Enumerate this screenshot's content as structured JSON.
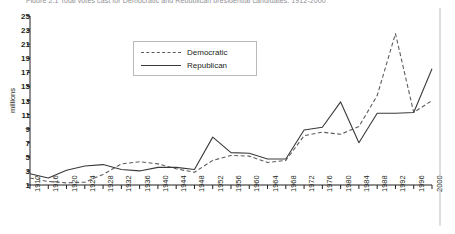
{
  "figure": {
    "caption": "Figure 2.1  Total votes cast for Democratic and Republican presidential candidates, 1912-2000"
  },
  "chart_data": {
    "type": "line",
    "title": "",
    "xlabel": "",
    "ylabel": "millions",
    "x": [
      1912,
      1916,
      1920,
      1924,
      1928,
      1932,
      1936,
      1940,
      1944,
      1948,
      1952,
      1956,
      1960,
      1964,
      1968,
      1972,
      1976,
      1980,
      1984,
      1988,
      1992,
      1996,
      2000
    ],
    "xlim": [
      1912,
      2000
    ],
    "ylim": [
      0,
      25
    ],
    "yticks": [
      1,
      3,
      5,
      7,
      9,
      11,
      13,
      15,
      17,
      19,
      21,
      23,
      25
    ],
    "xticks": [
      "1912",
      "1916",
      "1920",
      "1924",
      "1928",
      "1932",
      "1936",
      "1940",
      "1944",
      "1948",
      "1952",
      "1956",
      "1960",
      "1964",
      "1968",
      "1972",
      "1976",
      "1980",
      "1984",
      "1988",
      "1992",
      "1996",
      "2000"
    ],
    "grid": false,
    "legend_position": "upper-center",
    "series": [
      {
        "name": "Democratic",
        "style": "dashed",
        "color": "#5d5d60",
        "values": [
          6.3,
          9.1,
          9.1,
          8.4,
          15.0,
          22.8,
          27.8,
          27.3,
          25.6,
          24.2,
          27.3,
          26.0,
          34.2,
          43.1,
          31.3,
          29.2,
          40.8,
          35.5,
          37.6,
          41.8,
          44.9,
          47.4,
          51.0
        ]
      },
      {
        "name": "Republican",
        "style": "solid",
        "color": "#3a3a3c",
        "values": [
          3.5,
          8.5,
          16.1,
          15.7,
          21.4,
          15.8,
          16.7,
          22.3,
          22.0,
          22.0,
          34.1,
          35.6,
          34.1,
          27.2,
          31.8,
          47.2,
          39.1,
          43.9,
          54.5,
          48.9,
          39.1,
          39.2,
          50.5
        ]
      }
    ],
    "series_plotted": [
      {
        "name": "Democratic",
        "units": "millions",
        "points": [
          2.0,
          1.5,
          1.3,
          1.4,
          2.5,
          4.0,
          4.3,
          4.0,
          3.3,
          2.8,
          4.5,
          5.2,
          5.1,
          4.2,
          4.5,
          8.0,
          8.5,
          8.2,
          9.3,
          13.7,
          22.5,
          11.3,
          13.0
        ]
      },
      {
        "name": "Republican",
        "units": "millions",
        "points": [
          2.6,
          2.0,
          3.1,
          3.7,
          3.9,
          3.2,
          3.0,
          3.5,
          3.5,
          3.2,
          7.8,
          5.6,
          5.5,
          4.7,
          4.7,
          8.8,
          9.2,
          12.8,
          7.0,
          11.2,
          11.2,
          11.3,
          17.5
        ]
      }
    ],
    "legend": [
      "Democratic",
      "Republican"
    ]
  },
  "legend": {
    "democratic": "Democratic",
    "republican": "Republican"
  },
  "axis": {
    "ylabel": "millions"
  }
}
